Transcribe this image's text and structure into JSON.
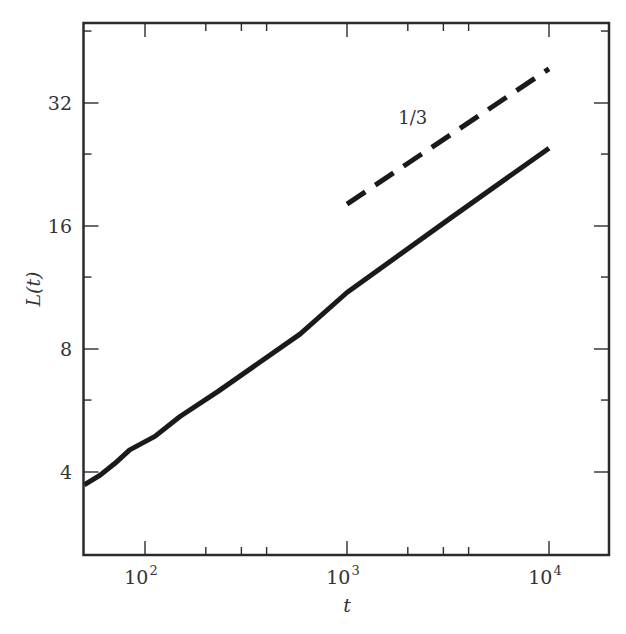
{
  "chart_data": {
    "type": "line",
    "title": "",
    "xlabel": "t",
    "ylabel": "L(t)",
    "xscale": "log10",
    "yscale": "log2",
    "xlim": [
      50,
      20000
    ],
    "ylim": [
      2.6,
      52
    ],
    "grid": false,
    "legend": null,
    "x_ticks": [
      {
        "value": 100,
        "label_base": "10",
        "label_exp": "2"
      },
      {
        "value": 1000,
        "label_base": "10",
        "label_exp": "3"
      },
      {
        "value": 10000,
        "label_base": "10",
        "label_exp": "4"
      }
    ],
    "x_minor_ticks": [
      200,
      300,
      400,
      2000,
      3000,
      4000
    ],
    "y_ticks": [
      {
        "value": 4,
        "label": "4"
      },
      {
        "value": 8,
        "label": "8"
      },
      {
        "value": 16,
        "label": "16"
      },
      {
        "value": 32,
        "label": "32"
      }
    ],
    "y_minor_ticks": [
      6,
      12,
      24,
      48
    ],
    "series": [
      {
        "name": "L(t)",
        "style": "solid",
        "color": "#1a1a1a",
        "x": [
          50,
          60,
          71,
          84,
          112,
          149,
          230,
          585,
          1000,
          3240,
          10000
        ],
        "y": [
          3.72,
          3.93,
          4.2,
          4.53,
          4.89,
          5.47,
          6.3,
          8.7,
          11.0,
          16.7,
          24.8
        ]
      },
      {
        "name": "slope 1/3 guide",
        "style": "dashed",
        "color": "#1a1a1a",
        "x": [
          1000,
          10000
        ],
        "y": [
          18.1,
          38.8
        ]
      }
    ],
    "annotations": [
      {
        "text": "1/3",
        "x": 2000,
        "y": 29
      }
    ]
  }
}
